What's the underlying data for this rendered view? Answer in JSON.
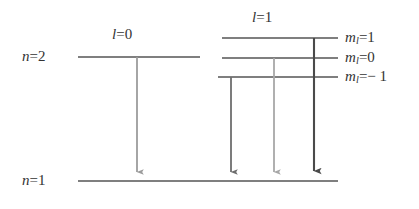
{
  "figure": {
    "type": "energy-level-diagram",
    "background_color": "#ffffff",
    "width": 419,
    "height": 209
  },
  "labels": {
    "n2": {
      "symbol": "n",
      "operator": "=",
      "value": "2",
      "text": "n = 2"
    },
    "n1": {
      "symbol": "n",
      "operator": "=",
      "value": "1",
      "text": "n = 1"
    },
    "l0": {
      "symbol": "l",
      "operator": "=",
      "value": "0",
      "text": "l = 0"
    },
    "l1": {
      "symbol": "l",
      "operator": "=",
      "value": "1",
      "text": "l = 1"
    },
    "ml_plus1": {
      "symbol": "m",
      "subscript": "l",
      "operator": "=",
      "value": "1",
      "text": "m_l = 1"
    },
    "ml_zero": {
      "symbol": "m",
      "subscript": "l",
      "operator": "=",
      "value": "0",
      "text": "m_l = 0"
    },
    "ml_minus1": {
      "symbol": "m",
      "subscript": "l",
      "operator": "=",
      "value": "− 1",
      "text": "m_l = -1"
    }
  },
  "levels": [
    {
      "id": "n2-l0",
      "label_ref": "n2",
      "sublabel_ref": "l0",
      "x1": 78,
      "x2": 200,
      "y": 57,
      "color": "#555555",
      "thickness": 1.6
    },
    {
      "id": "n2-l1-mp1",
      "label_ref": "ml_plus1",
      "sublabel_ref": "l1",
      "x1": 222,
      "x2": 338,
      "y": 38,
      "color": "#555555",
      "thickness": 1.6
    },
    {
      "id": "n2-l1-m0",
      "label_ref": "ml_zero",
      "sublabel_ref": "l1",
      "x1": 222,
      "x2": 338,
      "y": 58,
      "color": "#555555",
      "thickness": 1.6
    },
    {
      "id": "n2-l1-mm1",
      "label_ref": "ml_minus1",
      "sublabel_ref": "l1",
      "x1": 218,
      "x2": 338,
      "y": 77,
      "color": "#555555",
      "thickness": 1.6
    },
    {
      "id": "n1",
      "label_ref": "n1",
      "sublabel_ref": null,
      "x1": 78,
      "x2": 338,
      "y": 181,
      "color": "#555555",
      "thickness": 1.6
    }
  ],
  "transitions": [
    {
      "id": "arrow-l0",
      "from_level": "n2-l0",
      "to_level": "n1",
      "x": 137,
      "y_start": 57,
      "y_end": 180,
      "color": "#9c9c9c",
      "thickness": 1.8
    },
    {
      "id": "arrow-ml-m1",
      "from_level": "n2-l1-mm1",
      "to_level": "n1",
      "x": 231,
      "y_start": 77,
      "y_end": 180,
      "color": "#6e6e6e",
      "thickness": 1.8
    },
    {
      "id": "arrow-ml-0",
      "from_level": "n2-l1-m0",
      "to_level": "n1",
      "x": 274,
      "y_start": 58,
      "y_end": 180,
      "color": "#a8a8a8",
      "thickness": 1.8
    },
    {
      "id": "arrow-ml-p1",
      "from_level": "n2-l1-mp1",
      "to_level": "n1",
      "x": 314,
      "y_start": 38,
      "y_end": 180,
      "color": "#4a4a4a",
      "thickness": 2.1
    }
  ],
  "label_positions": {
    "n2": {
      "x": 22,
      "y": 49
    },
    "n1": {
      "x": 22,
      "y": 173
    },
    "l0": {
      "x": 112,
      "y": 27
    },
    "l1": {
      "x": 252,
      "y": 10
    },
    "ml_plus1": {
      "x": 345,
      "y": 30
    },
    "ml_zero": {
      "x": 345,
      "y": 50
    },
    "ml_minus1": {
      "x": 345,
      "y": 69
    }
  }
}
